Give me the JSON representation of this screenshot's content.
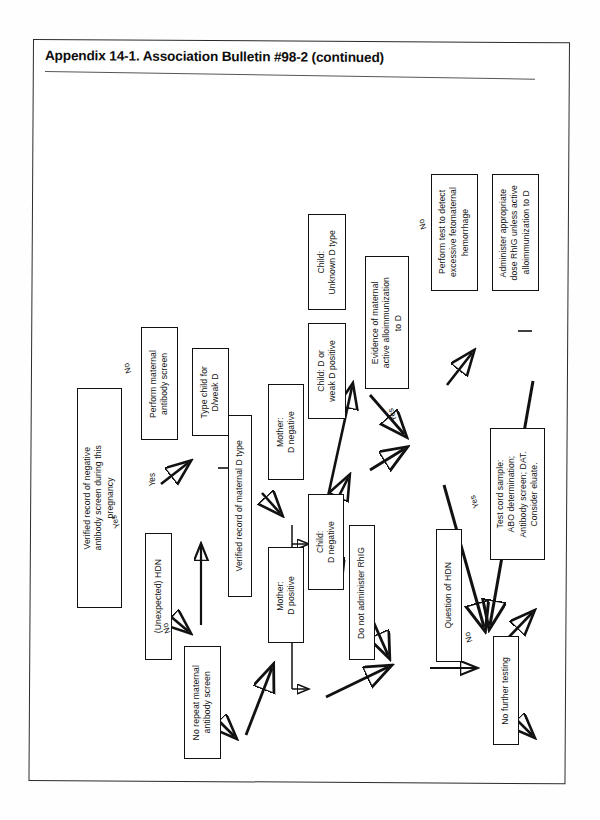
{
  "page": {
    "appendix_title": "Appendix 14-1. Association Bulletin #98-2 (continued)"
  },
  "chart": {
    "section_title": "Management at Delivery",
    "type": "flowchart",
    "nodes": [
      {
        "id": "n1",
        "label": "Verified record of negative\nantibody screen during this\npregnancy"
      },
      {
        "id": "n2",
        "label": "(Unexpected) HDN"
      },
      {
        "id": "n3",
        "label": "Perform maternal\nantibody screen"
      },
      {
        "id": "n4",
        "label": "No repeat maternal\nantibody screen"
      },
      {
        "id": "n5",
        "label": "Type child for\nD/weak D"
      },
      {
        "id": "n6",
        "label": "Verified record of maternal  D type"
      },
      {
        "id": "n7",
        "label": "Mother:\nD positive"
      },
      {
        "id": "n8",
        "label": "Mother:\nD negative"
      },
      {
        "id": "n9",
        "label": "Child:\nD negative"
      },
      {
        "id": "n10",
        "label": "Child: D or\nweak D positive"
      },
      {
        "id": "n11",
        "label": "Child:\nUnknown D type"
      },
      {
        "id": "n12",
        "label": "Do not administer RhIG"
      },
      {
        "id": "n13",
        "label": "Evidence of maternal\nactive alloimmunization\nto D"
      },
      {
        "id": "n14",
        "label": "Perform test to detect\nexcessive fetomaternal\nhemorrhage"
      },
      {
        "id": "n15",
        "label": "Administer appropriate\ndose RhIG unless active\nalloimmunization to D"
      },
      {
        "id": "n16",
        "label": "Question of HDN"
      },
      {
        "id": "n17",
        "label": "Test cord sample:\nABO determination;\nAntibody screen; DAT.\nConsider eluate."
      },
      {
        "id": "n18",
        "label": "No further testing"
      }
    ],
    "edge_labels": [
      {
        "id": "e1",
        "text": "No",
        "from": "n1",
        "to": "n3"
      },
      {
        "id": "e2",
        "text": "Yes",
        "from": "n1",
        "to": "n2"
      },
      {
        "id": "e3",
        "text": "Yes",
        "from": "n2",
        "to": "n3"
      },
      {
        "id": "e4",
        "text": "No",
        "from": "n2",
        "to": "n4"
      },
      {
        "id": "e5",
        "text": "Yes",
        "from": "n13",
        "to": "n16"
      },
      {
        "id": "e6",
        "text": "No",
        "from": "n13",
        "to": "n14"
      },
      {
        "id": "e7",
        "text": "Yes",
        "from": "n16",
        "to": "n17"
      },
      {
        "id": "e8",
        "text": "No",
        "from": "n16",
        "to": "n18"
      }
    ]
  }
}
